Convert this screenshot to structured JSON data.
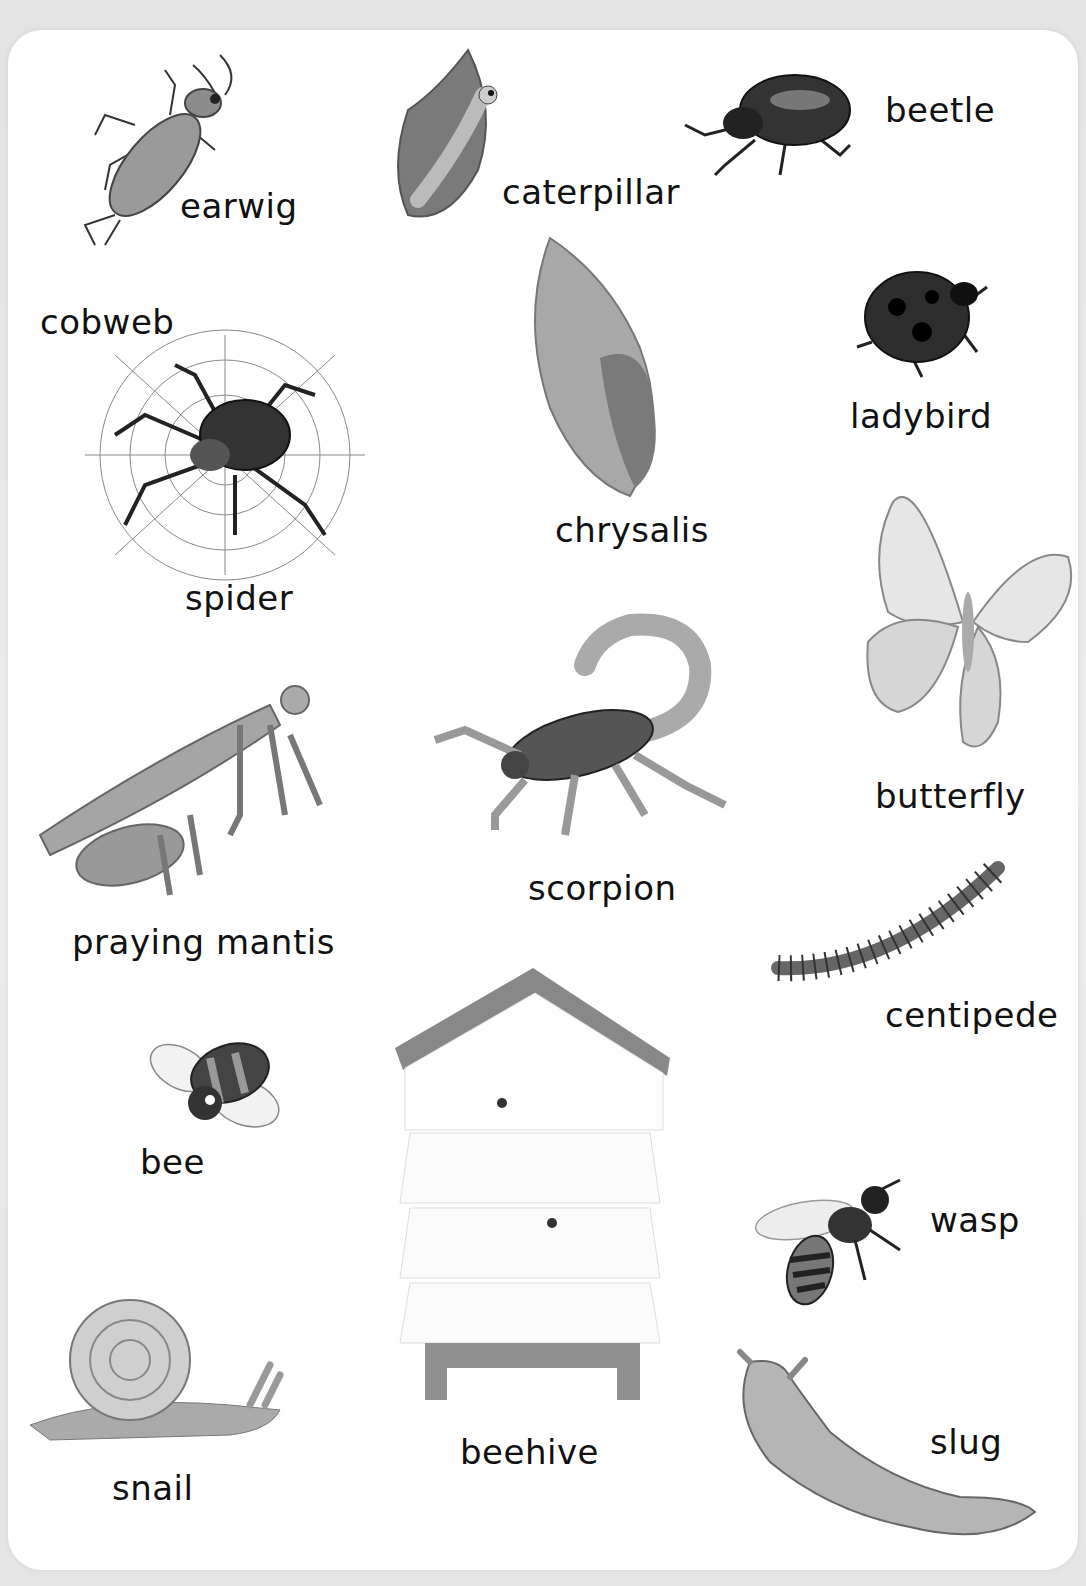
{
  "page": {
    "items": [
      {
        "id": "earwig",
        "label": "earwig"
      },
      {
        "id": "caterpillar",
        "label": "caterpillar"
      },
      {
        "id": "beetle",
        "label": "beetle"
      },
      {
        "id": "cobweb",
        "label": "cobweb"
      },
      {
        "id": "spider",
        "label": "spider"
      },
      {
        "id": "chrysalis",
        "label": "chrysalis"
      },
      {
        "id": "ladybird",
        "label": "ladybird"
      },
      {
        "id": "butterfly",
        "label": "butterfly"
      },
      {
        "id": "praying-mantis",
        "label": "praying mantis"
      },
      {
        "id": "scorpion",
        "label": "scorpion"
      },
      {
        "id": "centipede",
        "label": "centipede"
      },
      {
        "id": "bee",
        "label": "bee"
      },
      {
        "id": "beehive",
        "label": "beehive"
      },
      {
        "id": "wasp",
        "label": "wasp"
      },
      {
        "id": "snail",
        "label": "snail"
      },
      {
        "id": "slug",
        "label": "slug"
      }
    ]
  }
}
